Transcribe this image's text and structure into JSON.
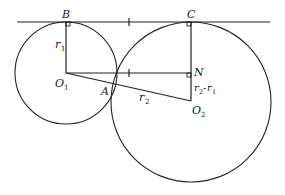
{
  "diagram": {
    "title": "",
    "colors": {
      "stroke": "#222222",
      "background": "#ffffff"
    },
    "points": {
      "B": {
        "label": "B",
        "x": 66,
        "y": 22
      },
      "C": {
        "label": "C",
        "x": 191,
        "y": 22
      },
      "O1": {
        "label": "O",
        "sub": "1",
        "x": 66,
        "y": 73
      },
      "O2": {
        "label": "O",
        "sub": "2",
        "x": 191,
        "y": 101
      },
      "N": {
        "label": "N",
        "x": 191,
        "y": 73
      },
      "A": {
        "label": "A",
        "x": 114,
        "y": 86
      }
    },
    "circles": [
      {
        "name": "circle-1",
        "cx": 66,
        "cy": 73,
        "r": 51
      },
      {
        "name": "circle-2",
        "cx": 191,
        "cy": 102,
        "r": 80
      }
    ],
    "segment_labels": {
      "r1": {
        "main": "r",
        "sub": "1"
      },
      "r2": {
        "main": "r",
        "sub": "2"
      },
      "r2_minus_r1": {
        "a": "r",
        "a_sub": "2",
        "sep": "-",
        "b": "r",
        "b_sub": "1"
      }
    },
    "right_angle_marks": [
      "B",
      "C",
      "N"
    ],
    "tick_marks": [
      "BC-midpoint",
      "O1N-midpoint"
    ]
  }
}
